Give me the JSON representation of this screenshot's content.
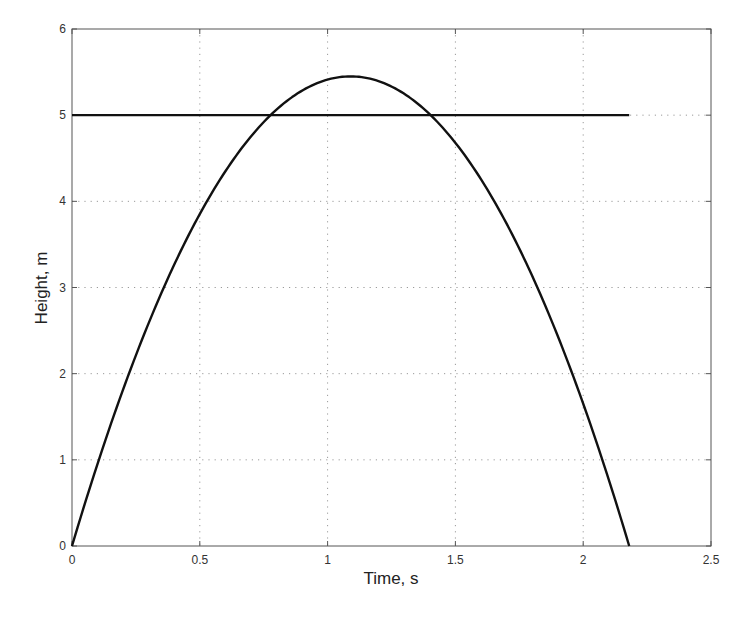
{
  "chart_data": {
    "type": "line",
    "title": "",
    "xlabel": "Time, s",
    "ylabel": "Height, m",
    "xlim": [
      0,
      2.5
    ],
    "ylim": [
      0,
      6
    ],
    "xticks": [
      0,
      0.5,
      1,
      1.5,
      2,
      2.5
    ],
    "xtick_labels": [
      "0",
      "0.5",
      "1",
      "1.5",
      "2",
      "2.5"
    ],
    "yticks": [
      0,
      1,
      2,
      3,
      4,
      5,
      6
    ],
    "ytick_labels": [
      "0",
      "1",
      "2",
      "3",
      "4",
      "5",
      "6"
    ],
    "grid": true,
    "grid_style": "dotted",
    "legend": null,
    "series": [
      {
        "name": "height trajectory",
        "color": "#111111",
        "x": [
          0,
          0.1,
          0.2,
          0.3,
          0.4,
          0.5,
          0.6,
          0.7,
          0.8,
          0.9,
          1.0,
          1.09,
          1.2,
          1.3,
          1.4,
          1.5,
          1.6,
          1.7,
          1.8,
          1.9,
          2.0,
          2.1,
          2.18
        ],
        "y": [
          0,
          0.95,
          1.81,
          2.58,
          3.26,
          3.85,
          4.35,
          4.76,
          5.07,
          5.29,
          5.42,
          5.45,
          5.42,
          5.25,
          5.01,
          4.71,
          4.36,
          3.92,
          3.4,
          2.8,
          2.11,
          1.35,
          0
        ]
      },
      {
        "name": "target height",
        "color": "#111111",
        "x": [
          0,
          2.18
        ],
        "y": [
          5,
          5
        ]
      }
    ]
  }
}
